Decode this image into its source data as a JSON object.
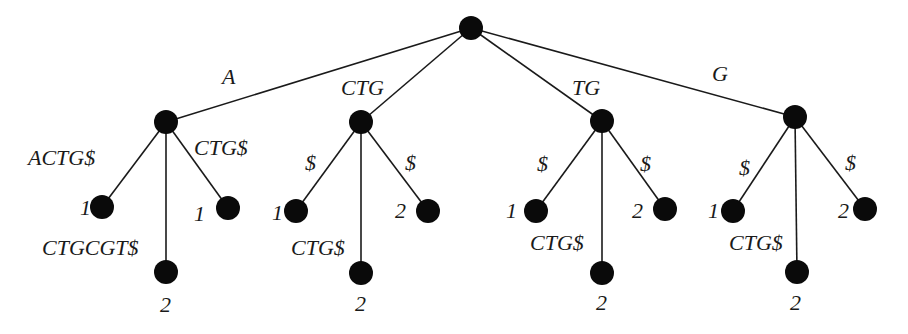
{
  "diagram": {
    "title": "",
    "type": "generalized suffix tree",
    "node_radius": 12,
    "colors": {
      "node": "#0a0a0a",
      "edge": "#1a1a1a",
      "text": "#1a1a1a",
      "background": "#ffffff"
    },
    "nodes": [
      {
        "id": "root",
        "x": 471,
        "y": 28
      },
      {
        "id": "A",
        "x": 166,
        "y": 122
      },
      {
        "id": "CTG",
        "x": 361,
        "y": 122
      },
      {
        "id": "TG",
        "x": 602,
        "y": 121
      },
      {
        "id": "G",
        "x": 795,
        "y": 117
      },
      {
        "id": "A-left",
        "x": 102,
        "y": 207,
        "leaf_label": "1",
        "leaf_label_x": 80,
        "leaf_label_y": 215
      },
      {
        "id": "A-mid",
        "x": 166,
        "y": 272,
        "leaf_label": "2",
        "leaf_label_x": 160,
        "leaf_label_y": 312
      },
      {
        "id": "A-right",
        "x": 228,
        "y": 208,
        "leaf_label": "1",
        "leaf_label_x": 194,
        "leaf_label_y": 221
      },
      {
        "id": "CTG-left",
        "x": 296,
        "y": 211,
        "leaf_label": "1",
        "leaf_label_x": 272,
        "leaf_label_y": 220
      },
      {
        "id": "CTG-mid",
        "x": 361,
        "y": 273,
        "leaf_label": "2",
        "leaf_label_x": 355,
        "leaf_label_y": 311
      },
      {
        "id": "CTG-right",
        "x": 428,
        "y": 211,
        "leaf_label": "2",
        "leaf_label_x": 395,
        "leaf_label_y": 218
      },
      {
        "id": "TG-left",
        "x": 536,
        "y": 211,
        "leaf_label": "1",
        "leaf_label_x": 506,
        "leaf_label_y": 218
      },
      {
        "id": "TG-mid",
        "x": 602,
        "y": 273,
        "leaf_label": "2",
        "leaf_label_x": 596,
        "leaf_label_y": 310
      },
      {
        "id": "TG-right",
        "x": 665,
        "y": 209,
        "leaf_label": "2",
        "leaf_label_x": 632,
        "leaf_label_y": 218
      },
      {
        "id": "G-left",
        "x": 733,
        "y": 211,
        "leaf_label": "1",
        "leaf_label_x": 708,
        "leaf_label_y": 218
      },
      {
        "id": "G-mid",
        "x": 797,
        "y": 272,
        "leaf_label": "2",
        "leaf_label_x": 790,
        "leaf_label_y": 310
      },
      {
        "id": "G-right",
        "x": 865,
        "y": 209,
        "leaf_label": "2",
        "leaf_label_x": 838,
        "leaf_label_y": 218
      }
    ],
    "edges": [
      {
        "from": "root",
        "to": "A",
        "label": "A",
        "lx": 222,
        "ly": 84
      },
      {
        "from": "root",
        "to": "CTG",
        "label": "CTG",
        "lx": 341,
        "ly": 95
      },
      {
        "from": "root",
        "to": "TG",
        "label": "TG",
        "lx": 572,
        "ly": 95
      },
      {
        "from": "root",
        "to": "G",
        "label": "G",
        "lx": 712,
        "ly": 81
      },
      {
        "from": "A",
        "to": "A-left",
        "label": "ACTG$",
        "lx": 28,
        "ly": 165
      },
      {
        "from": "A",
        "to": "A-mid",
        "label": "CTGCGT$",
        "lx": 42,
        "ly": 255
      },
      {
        "from": "A",
        "to": "A-right",
        "label": "CTG$",
        "lx": 194,
        "ly": 155
      },
      {
        "from": "CTG",
        "to": "CTG-left",
        "label": "$",
        "lx": 305,
        "ly": 170
      },
      {
        "from": "CTG",
        "to": "CTG-mid",
        "label": "CTG$",
        "lx": 291,
        "ly": 255
      },
      {
        "from": "CTG",
        "to": "CTG-right",
        "label": "$",
        "lx": 405,
        "ly": 170
      },
      {
        "from": "TG",
        "to": "TG-left",
        "label": "$",
        "lx": 537,
        "ly": 171
      },
      {
        "from": "TG",
        "to": "TG-mid",
        "label": "CTG$",
        "lx": 530,
        "ly": 250
      },
      {
        "from": "TG",
        "to": "TG-right",
        "label": "$",
        "lx": 640,
        "ly": 171
      },
      {
        "from": "G",
        "to": "G-left",
        "label": "$",
        "lx": 739,
        "ly": 175
      },
      {
        "from": "G",
        "to": "G-mid",
        "label": "CTG$",
        "lx": 729,
        "ly": 250
      },
      {
        "from": "G",
        "to": "G-right",
        "label": "$",
        "lx": 845,
        "ly": 170
      }
    ]
  }
}
